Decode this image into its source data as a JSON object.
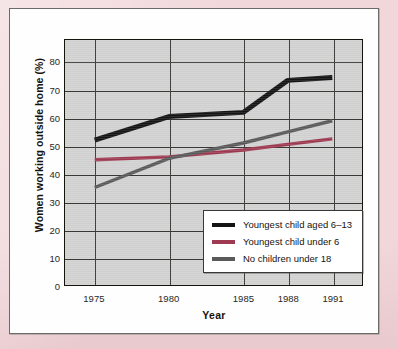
{
  "chart_data": {
    "type": "line",
    "title": "",
    "xlabel": "Year",
    "ylabel": "Women working outside home (%)",
    "categories": [
      "1975",
      "1980",
      "1985",
      "1988",
      "1991"
    ],
    "x": [
      1975,
      1980,
      1985,
      1988,
      1991
    ],
    "xlim": [
      1973,
      1993
    ],
    "ylim": [
      0,
      88
    ],
    "yticks": [
      "0",
      "10",
      "20",
      "30",
      "40",
      "50",
      "60",
      "70",
      "80"
    ],
    "ytick_values": [
      0,
      10,
      20,
      30,
      40,
      50,
      60,
      70,
      80
    ],
    "grid": "both",
    "legend_position": "lower-right-inside",
    "series": [
      {
        "name": "Youngest child aged 6–13",
        "color": "#141414",
        "values": [
          52,
          60.5,
          62,
          73.5,
          74.5
        ]
      },
      {
        "name": "Youngest child under 6",
        "color": "#9e3a52",
        "values": [
          45,
          46,
          48.5,
          50.5,
          52.5
        ]
      },
      {
        "name": "No children under 18",
        "color": "#5a5a5a",
        "values": [
          35,
          45.5,
          51,
          55,
          59
        ]
      }
    ]
  },
  "legend": {
    "items": [
      {
        "label": "Youngest child aged 6–13",
        "color": "#141414"
      },
      {
        "label": "Youngest child under 6",
        "color": "#9e3a52"
      },
      {
        "label": "No children under 18",
        "color": "#5a5a5a"
      }
    ]
  },
  "axes": {
    "y_title": "Women working outside home (%)",
    "x_title": "Year",
    "y_ticks": [
      "80",
      "70",
      "60",
      "50",
      "40",
      "30",
      "20",
      "10",
      "0"
    ],
    "x_ticks": [
      "1975",
      "1980",
      "1985",
      "1988",
      "1991"
    ]
  },
  "colors": {
    "page_background": "#f1d7da",
    "card_background": "#fefefe",
    "plot_background": "#d2d2d2",
    "axis": "#16130f",
    "grid": "#3a3835"
  }
}
